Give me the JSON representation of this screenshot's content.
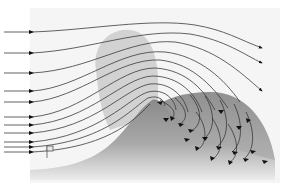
{
  "diagram": {
    "type": "airflow-over-hill",
    "colors": {
      "background": "#ffffff",
      "panel": "#f4f4f4",
      "windward_shade": "#cfcfcf",
      "hill_top": "#8e8e8e",
      "hill_bottom": "#e6e6e6",
      "eddy_zone": "#9a9a9a",
      "streamline": "#3a3a3a",
      "arrow": "#111111"
    },
    "inflow_arrows_y": [
      32,
      53,
      73,
      91,
      102,
      117,
      125,
      133,
      142,
      147,
      152
    ],
    "outflow_arrows_y": [
      48,
      63,
      91
    ],
    "small_marker": {
      "label": "",
      "x": 47,
      "y": 150
    }
  }
}
